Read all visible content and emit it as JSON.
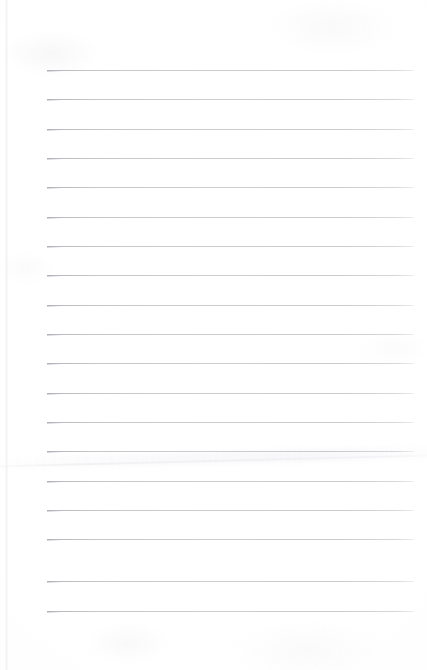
{
  "document": {
    "kind": "lined-notebook-page",
    "title": "Lined Notebook Page",
    "orientation": "portrait",
    "page_width_px": 427,
    "page_height_px": 670,
    "background_color": "#ffffff",
    "paper_tint_color": "#fdfdfe",
    "content_text": "",
    "is_blank": "true"
  },
  "ruling": {
    "style": "wide-ruled",
    "line_color": "#b4b4ba",
    "line_thickness_px": 1,
    "line_count": 19,
    "first_line_y_px": 70,
    "line_spacing_px": 29.3,
    "line_start_x_px": 47,
    "line_end_x_px": 414,
    "top_margin_px": 70,
    "bottom_margin_px": 59,
    "left_margin_px": 47,
    "right_margin_px": 13,
    "has_vertical_margin_rule": "false",
    "has_header_rule": "false"
  },
  "artifacts": {
    "left_page_edge_color": "#e7e7ed",
    "left_page_edge_x_px": 5,
    "crease_color": "#e0e0e7",
    "crease_y_px": 466,
    "crease_angle_deg": -1.45,
    "vignette_color": "#f7f7f9"
  },
  "lines": [
    {
      "index": 1,
      "y": 70
    },
    {
      "index": 2,
      "y": 99
    },
    {
      "index": 3,
      "y": 129
    },
    {
      "index": 4,
      "y": 158
    },
    {
      "index": 5,
      "y": 187
    },
    {
      "index": 6,
      "y": 217
    },
    {
      "index": 7,
      "y": 246
    },
    {
      "index": 8,
      "y": 275
    },
    {
      "index": 9,
      "y": 305
    },
    {
      "index": 10,
      "y": 334
    },
    {
      "index": 11,
      "y": 363
    },
    {
      "index": 12,
      "y": 393
    },
    {
      "index": 13,
      "y": 422
    },
    {
      "index": 14,
      "y": 451
    },
    {
      "index": 15,
      "y": 481
    },
    {
      "index": 16,
      "y": 510
    },
    {
      "index": 17,
      "y": 539
    },
    {
      "index": 18,
      "y": 581
    },
    {
      "index": 19,
      "y": 611
    }
  ]
}
